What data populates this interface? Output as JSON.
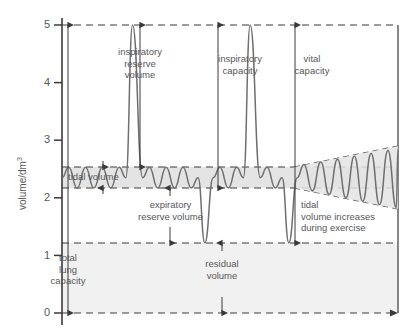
{
  "chart_data": {
    "type": "line",
    "title": "",
    "xlabel": "",
    "ylabel": "volume/dm3",
    "ylabel_display": "volume/dm",
    "ylabel_exponent": "3",
    "ylim": [
      0,
      5
    ],
    "xlim": [
      0,
      100
    ],
    "yticks": [
      0,
      1,
      2,
      3,
      4,
      5
    ],
    "ytick_labels": [
      "0",
      "1",
      "2",
      "3",
      "4",
      "5"
    ],
    "grid": false,
    "legend_position": "none",
    "reference_levels": [
      {
        "name": "total-lung-capacity-top",
        "value": 5.0,
        "style": "dashed"
      },
      {
        "name": "tidal-volume-top",
        "value": 2.53,
        "style": "dashed"
      },
      {
        "name": "tidal-volume-bottom",
        "value": 2.17,
        "style": "dashed"
      },
      {
        "name": "residual-volume-top",
        "value": 1.22,
        "style": "dashed"
      },
      {
        "name": "baseline-zero",
        "value": 0.0,
        "style": "dashed"
      }
    ],
    "bands": [
      {
        "name": "tidal-volume-band",
        "from": 2.17,
        "to": 2.53,
        "color": "#e3e3e3"
      },
      {
        "name": "residual-volume-band",
        "from": 0.0,
        "to": 1.22,
        "color": "#f0f0f0"
      }
    ],
    "series": [
      {
        "name": "spirometer-trace",
        "color": "#6f6f6f",
        "description": "Quiet tidal breathing, then maximum inspiration to total lung capacity, tidal breathing, maximum expiration to residual volume, then exercise breathing with increasing tidal volume",
        "points": [
          [
            0.0,
            2.35
          ],
          [
            2.0,
            2.53
          ],
          [
            4.5,
            2.17
          ],
          [
            7.0,
            2.53
          ],
          [
            9.5,
            2.17
          ],
          [
            12.0,
            2.53
          ],
          [
            14.5,
            2.17
          ],
          [
            17.0,
            2.53
          ],
          [
            19.0,
            2.35
          ],
          [
            21.0,
            5.0
          ],
          [
            24.0,
            2.35
          ],
          [
            26.0,
            2.53
          ],
          [
            28.5,
            2.17
          ],
          [
            31.0,
            2.53
          ],
          [
            33.5,
            2.17
          ],
          [
            36.0,
            2.53
          ],
          [
            38.5,
            2.17
          ],
          [
            40.5,
            2.35
          ],
          [
            42.5,
            1.22
          ],
          [
            45.0,
            2.35
          ],
          [
            47.0,
            2.53
          ],
          [
            49.5,
            2.17
          ],
          [
            52.0,
            2.53
          ],
          [
            54.0,
            2.35
          ],
          [
            56.0,
            5.0
          ],
          [
            59.0,
            2.35
          ],
          [
            61.0,
            2.53
          ],
          [
            63.5,
            2.17
          ],
          [
            65.5,
            2.35
          ],
          [
            67.5,
            1.22
          ],
          [
            70.0,
            2.35
          ],
          [
            72.0,
            2.58
          ],
          [
            74.5,
            2.12
          ],
          [
            77.0,
            2.62
          ],
          [
            79.5,
            2.06
          ],
          [
            82.0,
            2.67
          ],
          [
            84.5,
            2.0
          ],
          [
            87.0,
            2.72
          ],
          [
            89.5,
            1.94
          ],
          [
            92.0,
            2.77
          ],
          [
            94.5,
            1.88
          ],
          [
            97.0,
            2.82
          ],
          [
            99.5,
            1.83
          ],
          [
            100,
            2.85
          ]
        ]
      }
    ],
    "envelope": [
      {
        "name": "exercise-envelope-upper",
        "from": [
          70,
          2.53
        ],
        "to": [
          100,
          2.88
        ],
        "style": "dashed"
      },
      {
        "name": "exercise-envelope-lower",
        "from": [
          70,
          2.17
        ],
        "to": [
          100,
          1.8
        ],
        "style": "dashed"
      }
    ],
    "annotations": [
      {
        "name": "inspiratory-reserve-volume",
        "text": "inspiratory\nreserve\nvolume",
        "from": 5.0,
        "to": 2.53,
        "arrow": "both"
      },
      {
        "name": "tidal-volume",
        "text": "tidal volume",
        "from": 2.53,
        "to": 2.17,
        "arrow": "both"
      },
      {
        "name": "expiratory-reserve-volume",
        "text": "expiratory\nreserve volume",
        "from": 2.17,
        "to": 1.22,
        "arrow": "both"
      },
      {
        "name": "total-lung-capacity",
        "text": "total\nlung\ncapacity",
        "from": 5.0,
        "to": 0.0,
        "arrow": "both"
      },
      {
        "name": "inspiratory-capacity",
        "text": "inspiratory\ncapacity",
        "from": 5.0,
        "to": 2.17,
        "arrow": "both"
      },
      {
        "name": "vital-capacity",
        "text": "vital\ncapacity",
        "from": 5.0,
        "to": 1.22,
        "arrow": "both"
      },
      {
        "name": "residual-volume",
        "text": "residual\nvolume",
        "from": 1.22,
        "to": 0.0,
        "arrow": "both"
      },
      {
        "name": "tidal-volume-increases-during-exercise",
        "text": "tidal\nvolume increases\nduring exercise",
        "arrow": "none"
      }
    ]
  },
  "labels": {
    "y_axis": "volume/dm",
    "y_axis_exp": "3",
    "inspiratory_reserve_volume": "inspiratory\nreserve\nvolume",
    "tidal_volume": "tidal volume",
    "expiratory_reserve_volume": "expiratory\nreserve volume",
    "total_lung_capacity": "total\nlung\ncapacity",
    "inspiratory_capacity": "inspiratory\ncapacity",
    "vital_capacity": "vital\ncapacity",
    "residual_volume": "residual\nvolume",
    "tidal_volume_exercise": "tidal\nvolume increases\nduring exercise",
    "tick_5": "5",
    "tick_4": "4",
    "tick_3": "3",
    "tick_2": "2",
    "tick_1": "1",
    "tick_0": "0"
  },
  "colors": {
    "trace": "#6f6f6f",
    "text": "#58585a",
    "axis": "#3a3a3a",
    "band": "#e3e3e3",
    "residual_band": "#f0f0f0",
    "dash": "#3a3a3a"
  }
}
